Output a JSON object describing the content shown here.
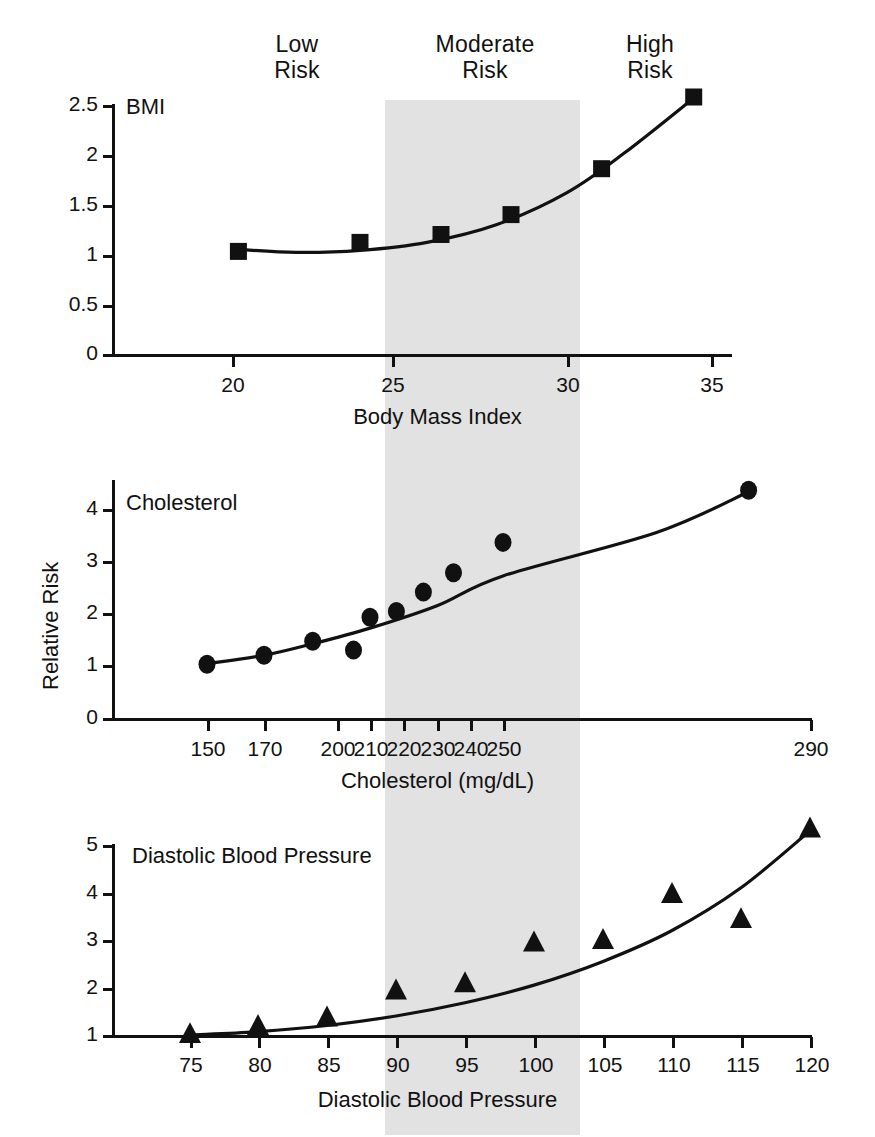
{
  "figure": {
    "risk_bands": [
      {
        "id": "low",
        "label": "Low\nRisk"
      },
      {
        "id": "moderate",
        "label": "Moderate\nRisk"
      },
      {
        "id": "high",
        "label": "High\nRisk"
      }
    ],
    "shaded_band_color": "#e2e2e2",
    "ink_color": "#111111"
  },
  "chart_data": [
    {
      "type": "scatter",
      "title": "BMI",
      "xlabel": "Body Mass Index",
      "ylabel": "",
      "xlim": [
        17.5,
        36.5
      ],
      "ylim": [
        0,
        2.62
      ],
      "xticks": [
        20,
        25,
        30,
        35
      ],
      "yticks": [
        0,
        0.5,
        1,
        1.5,
        2,
        2.5
      ],
      "ytick_labels": [
        "0",
        "0.5",
        "1",
        "1.5",
        "2",
        "2.5"
      ],
      "xtick_labels": [
        "20",
        "25",
        "30",
        "35"
      ],
      "grid": false,
      "marker": "square",
      "shaded_x_range": [
        25,
        30
      ],
      "x": [
        20.2,
        24.0,
        26.4,
        28.4,
        31.2,
        34.4
      ],
      "values": [
        1.03,
        1.12,
        1.2,
        1.4,
        1.86,
        2.58
      ],
      "fit_curve_x": [
        20.2,
        22.0,
        24.0,
        26.0,
        28.0,
        30.0,
        32.0,
        34.4
      ],
      "fit_curve_values": [
        1.05,
        1.02,
        1.04,
        1.12,
        1.3,
        1.62,
        2.02,
        2.57
      ]
    },
    {
      "type": "scatter",
      "title": "Cholesterol",
      "xlabel": "Cholesterol (mg/dL)",
      "ylabel": "Relative Risk",
      "xlim": [
        137,
        297
      ],
      "ylim": [
        0,
        4.5
      ],
      "xticks": [
        150,
        170,
        200,
        210,
        220,
        230,
        240,
        250,
        290
      ],
      "xtick_labels": [
        "150",
        "170",
        "200",
        "210",
        "220",
        "230",
        "240",
        "250",
        "290"
      ],
      "yticks": [
        0,
        1,
        2,
        3,
        4
      ],
      "ytick_labels": [
        "0",
        "1",
        "2",
        "3",
        "4"
      ],
      "grid": false,
      "marker": "circle",
      "shaded_x_range": [
        200,
        240
      ],
      "x": [
        150,
        170,
        190,
        205,
        210,
        218,
        226,
        235,
        250,
        282
      ],
      "values": [
        1.03,
        1.2,
        1.47,
        1.3,
        1.93,
        2.04,
        2.41,
        2.78,
        3.36,
        4.36
      ],
      "fit_curve_x": [
        150,
        170,
        190,
        210,
        230,
        250,
        270,
        282
      ],
      "fit_curve_values": [
        1.04,
        1.2,
        1.42,
        1.72,
        2.15,
        2.72,
        3.55,
        4.33
      ]
    },
    {
      "type": "scatter",
      "title": "Diastolic Blood Pressure",
      "xlabel": "Diastolic Blood Pressure",
      "ylabel": "",
      "xlim": [
        71,
        123
      ],
      "ylim": [
        1,
        5.45
      ],
      "xticks": [
        75,
        80,
        85,
        90,
        95,
        100,
        105,
        110,
        115,
        120
      ],
      "xtick_labels": [
        "75",
        "80",
        "85",
        "90",
        "95",
        "100",
        "105",
        "110",
        "115",
        "120"
      ],
      "yticks": [
        1,
        2,
        3,
        4,
        5
      ],
      "ytick_labels": [
        "1",
        "2",
        "3",
        "4",
        "5"
      ],
      "grid": false,
      "marker": "triangle",
      "shaded_x_range": [
        90,
        102.7
      ],
      "x": [
        75,
        80,
        85,
        90,
        95,
        100,
        105,
        110,
        115,
        120
      ],
      "values": [
        1.05,
        1.22,
        1.4,
        1.97,
        2.12,
        2.98,
        3.03,
        4.0,
        3.47,
        5.38
      ],
      "fit_curve_x": [
        75,
        80,
        85,
        90,
        95,
        100,
        105,
        110,
        115,
        120
      ],
      "fit_curve_values": [
        1.0,
        1.07,
        1.2,
        1.4,
        1.68,
        2.05,
        2.55,
        3.2,
        4.1,
        5.3
      ]
    }
  ]
}
